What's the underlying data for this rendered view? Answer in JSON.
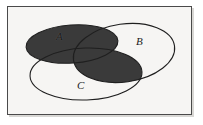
{
  "figure": {
    "kind": "venn-diagram",
    "title": "",
    "background_color": "#f6f5f3",
    "frame_color": "#4a4a4a",
    "shade_color": "#3a3a3a",
    "outline_color": "#1f1f1f",
    "shaded_region_description": "A union (B intersect C)"
  },
  "sets": [
    {
      "id": "A",
      "label": "A",
      "label_position": "upper-left",
      "filled": true,
      "fill_color": "#3a3a3a",
      "cx": 72,
      "cy": 44,
      "rx": 46,
      "ry": 19,
      "rotate": -4
    },
    {
      "id": "B",
      "label": "B",
      "label_position": "upper-right",
      "filled": false,
      "fill_color": "none",
      "cx": 124,
      "cy": 53,
      "rx": 51,
      "ry": 29,
      "rotate": -8
    },
    {
      "id": "C",
      "label": "C",
      "label_position": "lower-left",
      "filled": false,
      "fill_color": "none",
      "cx": 86,
      "cy": 74,
      "rx": 56,
      "ry": 26,
      "rotate": -2
    }
  ],
  "labels": {
    "a": "A",
    "b": "B",
    "c": "C"
  }
}
